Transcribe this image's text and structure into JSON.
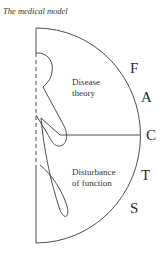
{
  "title": "The medical model",
  "regions": {
    "upper": {
      "line1": "Disease",
      "line2": "theory"
    },
    "lower": {
      "line1": "Disturbance",
      "line2": "of function"
    }
  },
  "arc_letters": [
    "F",
    "A",
    "C",
    "T",
    "S"
  ],
  "colors": {
    "stroke": "#3a3a3a",
    "text": "#2b2b2b",
    "background": "#ffffff"
  }
}
